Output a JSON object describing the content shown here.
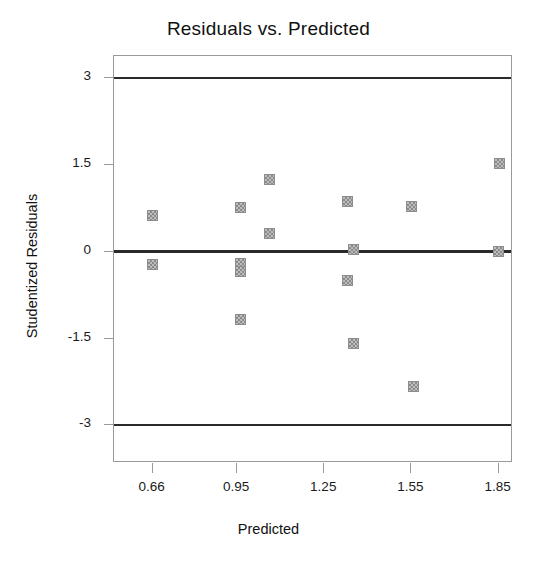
{
  "chart_data": {
    "type": "scatter",
    "title": "Residuals vs. Predicted",
    "xlabel": "Predicted",
    "ylabel": "Studentized Residuals",
    "xlim": [
      0.5267,
      1.8993
    ],
    "ylim": [
      -3.65,
      3.38
    ],
    "grid": false,
    "legend": null,
    "xticks": [
      0.66,
      0.95,
      1.25,
      1.55,
      1.85
    ],
    "xtick_labels": [
      "0.66",
      "0.95",
      "1.25",
      "1.55",
      "1.85"
    ],
    "yticks": [
      3,
      1.5,
      0,
      -1.5,
      -3
    ],
    "ytick_labels": [
      "3",
      "1.5",
      "0",
      "-1.5",
      "-3"
    ],
    "reference_lines": [
      {
        "name": "upper-limit-line",
        "y": 3,
        "style": "thin"
      },
      {
        "name": "zero-line",
        "y": 0,
        "style": "thick"
      },
      {
        "name": "lower-limit-line",
        "y": -3,
        "style": "thin"
      }
    ],
    "marker": {
      "shape": "square",
      "size": 11,
      "facecolor": "#bdbdbd",
      "edgecolor": "#8d8d8d"
    },
    "points": [
      {
        "x": 0.66,
        "y": 0.63
      },
      {
        "x": 0.66,
        "y": -0.22
      },
      {
        "x": 0.963,
        "y": 0.76
      },
      {
        "x": 0.963,
        "y": -0.2
      },
      {
        "x": 0.963,
        "y": -0.35
      },
      {
        "x": 0.963,
        "y": -1.17
      },
      {
        "x": 1.063,
        "y": 1.25
      },
      {
        "x": 1.063,
        "y": 0.32
      },
      {
        "x": 1.33,
        "y": 0.87
      },
      {
        "x": 1.35,
        "y": 0.03
      },
      {
        "x": 1.33,
        "y": -0.5
      },
      {
        "x": 1.35,
        "y": -1.58
      },
      {
        "x": 1.55,
        "y": 0.78
      },
      {
        "x": 1.556,
        "y": -2.32
      },
      {
        "x": 1.852,
        "y": 1.52
      },
      {
        "x": 1.848,
        "y": 0.0
      }
    ]
  },
  "chart": {
    "title": "Residuals vs. Predicted",
    "xlabel": "Predicted",
    "ylabel": "Studentized Residuals"
  },
  "axis": {
    "y_labels": [
      "3",
      "1.5",
      "0",
      "-1.5",
      "-3"
    ],
    "x_labels": [
      "0.66",
      "0.95",
      "1.25",
      "1.55",
      "1.85"
    ]
  }
}
